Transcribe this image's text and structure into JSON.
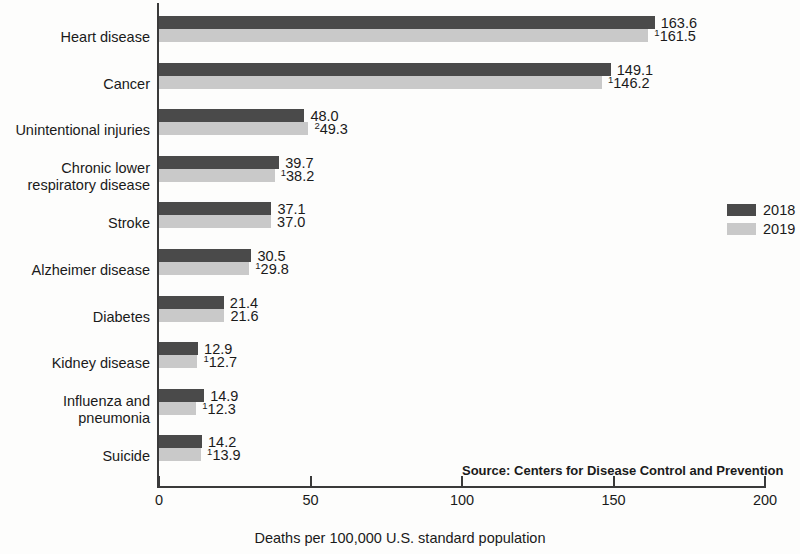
{
  "chart_data": {
    "type": "bar",
    "orientation": "horizontal",
    "title": "",
    "xlabel": "Deaths per 100,000 U.S. standard population",
    "ylabel": "",
    "xlim": [
      0,
      200
    ],
    "xticks": [
      "0",
      "50",
      "100",
      "150",
      "200"
    ],
    "grid": false,
    "legend_position": "right",
    "categories": [
      "Heart disease",
      "Cancer",
      "Unintentional injuries",
      "Chronic lower\nrespiratory disease",
      "Stroke",
      "Alzheimer disease",
      "Diabetes",
      "Kidney disease",
      "Influenza and\npneumonia",
      "Suicide"
    ],
    "series": [
      {
        "name": "2018",
        "color": "#4a4a4a",
        "values": [
          163.6,
          149.1,
          48.0,
          39.7,
          37.1,
          30.5,
          21.4,
          12.9,
          14.9,
          14.2
        ],
        "labels": [
          "163.6",
          "149.1",
          "48.0",
          "39.7",
          "37.1",
          "30.5",
          "21.4",
          "12.9",
          "14.9",
          "14.2"
        ],
        "label_marks": [
          "",
          "",
          "",
          "",
          "",
          "",
          "",
          "",
          "",
          ""
        ]
      },
      {
        "name": "2019",
        "color": "#c9c9c9",
        "values": [
          161.5,
          146.2,
          49.3,
          38.2,
          37.0,
          29.8,
          21.6,
          12.7,
          12.3,
          13.9
        ],
        "labels": [
          "161.5",
          "146.2",
          "49.3",
          "38.2",
          "37.0",
          "29.8",
          "21.6",
          "12.7",
          "12.3",
          "13.9"
        ],
        "label_marks": [
          "1",
          "1",
          "2",
          "1",
          "",
          "1",
          "",
          "1",
          "1",
          "1"
        ]
      }
    ],
    "source_note": "Source: Centers for Disease Control and Prevention"
  },
  "legend": {
    "items": [
      {
        "label": "2018",
        "color": "#4a4a4a"
      },
      {
        "label": "2019",
        "color": "#c9c9c9"
      }
    ]
  }
}
